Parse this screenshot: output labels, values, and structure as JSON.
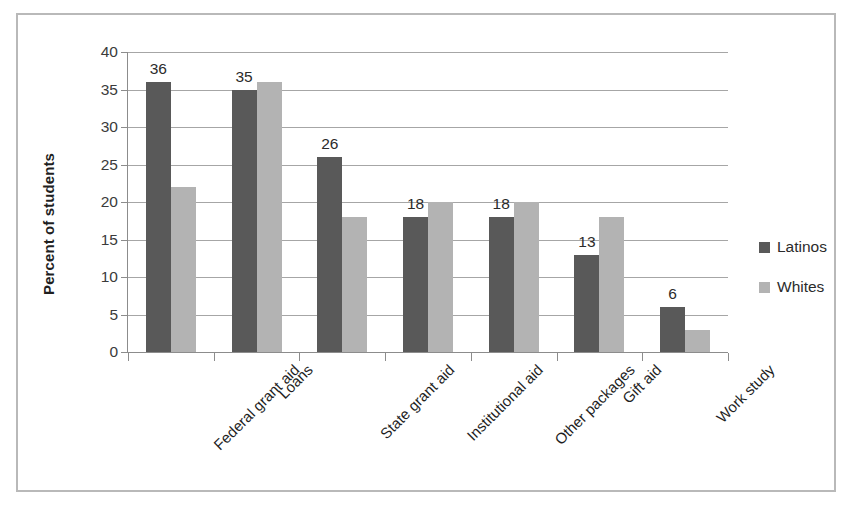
{
  "chart_data": {
    "type": "bar",
    "title": "",
    "subtitle": "",
    "xlabel": "",
    "ylabel": "Percent of students",
    "ylim": [
      0,
      40
    ],
    "ytick_step": 5,
    "yticks": [
      40,
      35,
      30,
      25,
      20,
      15,
      10,
      5,
      0
    ],
    "grid": true,
    "grid_axis": "y",
    "legend_position": "right",
    "categories": [
      "Federal grant aid",
      "Loans",
      "State grant aid",
      "Institutional aid",
      "Other packages",
      "Gift aid",
      "Work study"
    ],
    "series": [
      {
        "name": "Latinos",
        "color": "#595959",
        "values": [
          36,
          35,
          26,
          18,
          18,
          13,
          6
        ],
        "data_labels": [
          "36",
          "35",
          "26",
          "18",
          "18",
          "13",
          "6"
        ],
        "data_labels_shown": true
      },
      {
        "name": "Whites",
        "color": "#b3b3b3",
        "values": [
          22,
          36,
          18,
          20,
          20,
          18,
          3
        ],
        "data_labels": [
          "",
          "",
          "",
          "",
          "",
          "",
          ""
        ],
        "data_labels_shown": false
      }
    ]
  },
  "legend": {
    "entries": [
      {
        "label": "Latinos",
        "color": "#595959"
      },
      {
        "label": "Whites",
        "color": "#b3b3b3"
      }
    ]
  },
  "axis": {
    "y_title": "Percent of students"
  },
  "style": {
    "frame_border_color": "#b9b9b9",
    "gridline_color": "#a6a6a6",
    "axis_line_color": "#8c8c8c",
    "text_color": "#1f1f1f",
    "background": "#ffffff"
  }
}
